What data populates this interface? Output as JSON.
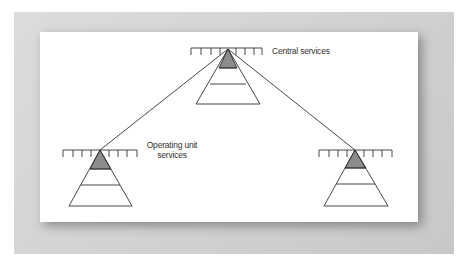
{
  "diagram": {
    "type": "hierarchy",
    "nodes": [
      {
        "id": "central",
        "label": "Central services",
        "shape": "pyramid-with-rail"
      },
      {
        "id": "left",
        "label_line1": "Operating unit",
        "label_line2": "services",
        "shape": "pyramid-with-rail"
      },
      {
        "id": "right",
        "label": "",
        "shape": "pyramid-with-rail"
      }
    ],
    "edges": [
      {
        "from": "central",
        "to": "left"
      },
      {
        "from": "central",
        "to": "right"
      }
    ],
    "colors": {
      "line": "#333333",
      "apex_fill": "#8c8c8c",
      "background_frame": "#d4d4d4",
      "panel": "#ffffff"
    }
  },
  "labels": {
    "central": "Central services",
    "operating_line1": "Operating unit",
    "operating_line2": "services"
  }
}
